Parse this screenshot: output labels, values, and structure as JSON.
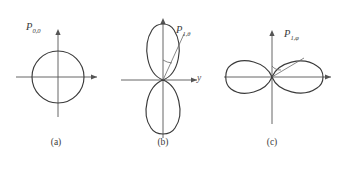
{
  "figure": {
    "background_color": "#ffffff",
    "line_color": "#3a3a3a",
    "axis_color": "#555555"
  },
  "panels": [
    {
      "id": "a",
      "caption": "(a)",
      "curve_label": "P",
      "curve_label_sub": "0,0",
      "pattern_type": "omnidirectional circle",
      "axis_label": "",
      "origin": {
        "x": 58,
        "y": 77
      },
      "radius": 26
    },
    {
      "id": "b",
      "caption": "(b)",
      "curve_label": "P",
      "curve_label_sub": "1,θ",
      "pattern_type": "vertical figure-eight dipole",
      "axis_label": "y",
      "origin": {
        "x": 163,
        "y": 80
      },
      "lobe_length": 57,
      "lobe_width": 26
    },
    {
      "id": "c",
      "caption": "(c)",
      "curve_label": "P",
      "curve_label_sub": "1,φ",
      "pattern_type": "horizontal figure-eight dipole",
      "axis_label": "",
      "origin": {
        "x": 272,
        "y": 77
      },
      "lobe_length": 48,
      "lobe_width": 26
    }
  ]
}
